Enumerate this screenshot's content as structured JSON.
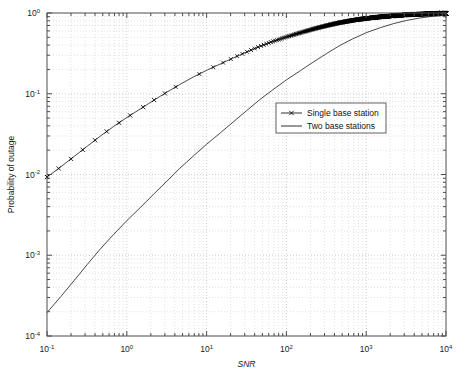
{
  "figure": {
    "title": "",
    "background_color": "#ffffff",
    "plot_box": {
      "left": 47,
      "top": 13,
      "right": 446,
      "bottom": 336
    }
  },
  "axes": {
    "x_label": "SNR",
    "y_label": "Probability of outage",
    "x_ticklabels": [
      "10-1",
      "100",
      "101",
      "102",
      "103",
      "104"
    ],
    "y_ticklabels": [
      "100",
      "10-1",
      "10-2",
      "10-3",
      "10-4"
    ]
  },
  "legend": {
    "position": "center-right",
    "entries": [
      {
        "label": "Single base station",
        "marker": "x",
        "line": "solid",
        "color": "#1a1a1a"
      },
      {
        "label": "Two base stations",
        "marker": "none",
        "line": "solid",
        "color": "#1a1a1a"
      }
    ]
  },
  "chart_data": {
    "type": "line",
    "title": "",
    "xlabel": "SNR",
    "ylabel": "Probability of outage",
    "xscale": "log",
    "yscale": "log",
    "xlim": [
      0.1,
      10000
    ],
    "ylim": [
      0.0001,
      1
    ],
    "grid": true,
    "grid_style": "dotted-minor-and-major",
    "legend_position": "center-right",
    "x_tick_values": [
      0.1,
      1,
      10,
      100,
      1000,
      10000
    ],
    "x_tick_labels": [
      "10^-1",
      "10^0",
      "10^1",
      "10^2",
      "10^3",
      "10^4"
    ],
    "y_tick_values": [
      1,
      0.1,
      0.01,
      0.001,
      0.0001
    ],
    "y_tick_labels": [
      "10^0",
      "10^-1",
      "10^-2",
      "10^-3",
      "10^-4"
    ],
    "series": [
      {
        "name": "Single base station",
        "marker": "x",
        "linestyle": "-",
        "color": "#1a1a1a",
        "x": [
          0.1,
          0.15,
          0.22,
          0.32,
          0.46,
          0.68,
          1.0,
          1.5,
          2.2,
          3.2,
          4.6,
          6.8,
          10,
          15,
          22,
          32,
          46,
          68,
          100,
          150,
          220,
          320,
          460,
          680,
          1000,
          1500,
          2200,
          3200,
          4600,
          6800,
          10000
        ],
        "y": [
          0.0093,
          0.0125,
          0.0168,
          0.0224,
          0.0296,
          0.0392,
          0.0508,
          0.0655,
          0.0836,
          0.105,
          0.13,
          0.161,
          0.195,
          0.235,
          0.28,
          0.33,
          0.385,
          0.445,
          0.505,
          0.57,
          0.635,
          0.698,
          0.757,
          0.812,
          0.857,
          0.895,
          0.926,
          0.95,
          0.967,
          0.98,
          0.99
        ]
      },
      {
        "name": "Two base stations",
        "marker": "none",
        "linestyle": "-",
        "color": "#1a1a1a",
        "x": [
          0.1,
          0.15,
          0.22,
          0.32,
          0.46,
          0.68,
          1.0,
          1.5,
          2.2,
          3.2,
          4.6,
          6.8,
          10,
          15,
          22,
          32,
          46,
          68,
          100,
          150,
          220,
          320,
          460,
          680,
          1000,
          1500,
          2200,
          3200,
          4600,
          6800,
          10000
        ],
        "y": [
          0.000195,
          0.00031,
          0.00049,
          0.00077,
          0.00118,
          0.0018,
          0.00268,
          0.00396,
          0.00578,
          0.00833,
          0.0119,
          0.0169,
          0.0237,
          0.033,
          0.0455,
          0.0622,
          0.084,
          0.1125,
          0.1485,
          0.1935,
          0.249,
          0.3155,
          0.393,
          0.479,
          0.57,
          0.658,
          0.739,
          0.808,
          0.864,
          0.911,
          0.95
        ]
      }
    ]
  }
}
